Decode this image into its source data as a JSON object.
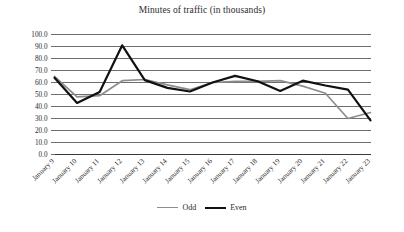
{
  "chart_data": {
    "type": "line",
    "title": "Minutes of traffic (in thousands)",
    "xlabel": "",
    "ylabel": "",
    "ylim": [
      0.0,
      100.0
    ],
    "ytick_step": 10.0,
    "grid": "horizontal",
    "legend_position": "bottom-center",
    "categories": [
      "January 9",
      "January 10",
      "January 11",
      "January 12",
      "January 13",
      "January 14",
      "January 15",
      "January 16",
      "January 17",
      "January 18",
      "January 19",
      "January 20",
      "January 21",
      "January 22",
      "January 23"
    ],
    "ytick_labels": [
      "100.0",
      "90.0",
      "80.0",
      "70.0",
      "60.0",
      "50.0",
      "40.0",
      "30.0",
      "20.0",
      "10.0",
      "0.0"
    ],
    "series": [
      {
        "name": "Odd",
        "color": "#8d8d8d",
        "width": 1.7,
        "values": [
          65.0,
          48.0,
          49.0,
          61.5,
          62.5,
          58.0,
          54.0,
          60.0,
          61.0,
          61.0,
          61.5,
          57.0,
          51.0,
          30.0,
          35.0
        ]
      },
      {
        "name": "Even",
        "color": "#111111",
        "width": 2.2,
        "values": [
          64.0,
          43.0,
          52.0,
          91.0,
          62.0,
          55.5,
          52.5,
          60.0,
          65.5,
          61.0,
          53.0,
          61.5,
          57.5,
          54.0,
          28.5
        ]
      }
    ]
  },
  "legend": {
    "items": [
      {
        "label": "Odd"
      },
      {
        "label": "Even"
      }
    ]
  }
}
